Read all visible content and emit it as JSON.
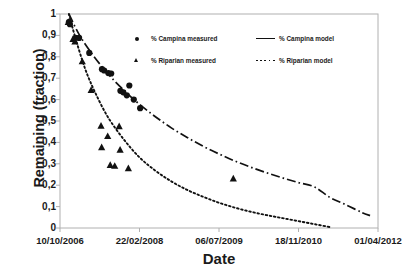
{
  "chart_data": {
    "type": "scatter",
    "title": "",
    "xlabel": "Date",
    "ylabel": "Remaining (fraction)",
    "ylim": [
      0,
      1
    ],
    "ytick_labels": [
      "1",
      "0,9",
      "0,8",
      "0,7",
      "0,6",
      "0,5",
      "0,4",
      "0,3",
      "0,2",
      "0,1",
      "0"
    ],
    "ytick_values": [
      1,
      0.9,
      0.8,
      0.7,
      0.6,
      0.5,
      0.4,
      0.3,
      0.2,
      0.1,
      0
    ],
    "xtick_labels": [
      "10/10/2006",
      "22/02/2008",
      "06/07/2009",
      "18/11/2010",
      "01/04/2012"
    ],
    "xtick_positions": [
      0,
      0.25,
      0.5,
      0.75,
      1.0
    ],
    "grid": false,
    "legend_position": "upper-center",
    "series": [
      {
        "name": "% Campina measured",
        "marker": "circle",
        "kind": "points",
        "color": "#111111",
        "points": [
          {
            "x": 0.028,
            "y": 0.962
          },
          {
            "x": 0.031,
            "y": 0.952
          },
          {
            "x": 0.049,
            "y": 0.889
          },
          {
            "x": 0.06,
            "y": 0.888
          },
          {
            "x": 0.092,
            "y": 0.818
          },
          {
            "x": 0.132,
            "y": 0.742
          },
          {
            "x": 0.139,
            "y": 0.736
          },
          {
            "x": 0.152,
            "y": 0.724
          },
          {
            "x": 0.161,
            "y": 0.722
          },
          {
            "x": 0.19,
            "y": 0.641
          },
          {
            "x": 0.199,
            "y": 0.634
          },
          {
            "x": 0.21,
            "y": 0.62
          },
          {
            "x": 0.218,
            "y": 0.666
          },
          {
            "x": 0.232,
            "y": 0.6
          },
          {
            "x": 0.252,
            "y": 0.56
          }
        ]
      },
      {
        "name": "% Riparian measured",
        "marker": "triangle",
        "kind": "points",
        "color": "#111111",
        "points": [
          {
            "x": 0.026,
            "y": 0.963
          },
          {
            "x": 0.041,
            "y": 0.884
          },
          {
            "x": 0.047,
            "y": 0.872
          },
          {
            "x": 0.07,
            "y": 0.779
          },
          {
            "x": 0.098,
            "y": 0.645
          },
          {
            "x": 0.129,
            "y": 0.478
          },
          {
            "x": 0.15,
            "y": 0.43
          },
          {
            "x": 0.131,
            "y": 0.378
          },
          {
            "x": 0.158,
            "y": 0.295
          },
          {
            "x": 0.172,
            "y": 0.291
          },
          {
            "x": 0.186,
            "y": 0.476
          },
          {
            "x": 0.189,
            "y": 0.366
          },
          {
            "x": 0.215,
            "y": 0.28
          },
          {
            "x": 0.545,
            "y": 0.232
          }
        ]
      },
      {
        "name": "% Campina model",
        "kind": "line",
        "style": "dash-dot",
        "color": "#111111",
        "x": [
          0.028,
          0.06,
          0.1,
          0.15,
          0.2,
          0.25,
          0.3,
          0.35,
          0.4,
          0.45,
          0.5,
          0.55,
          0.6,
          0.65,
          0.7,
          0.75,
          0.8,
          0.85,
          0.9,
          0.95,
          0.975
        ],
        "y": [
          1.0,
          0.905,
          0.815,
          0.722,
          0.645,
          0.578,
          0.52,
          0.468,
          0.423,
          0.382,
          0.346,
          0.313,
          0.284,
          0.258,
          0.234,
          0.212,
          0.192,
          0.142,
          0.108,
          0.072,
          0.058
        ]
      },
      {
        "name": "% Riparian model",
        "kind": "line",
        "style": "dotted",
        "color": "#111111",
        "x": [
          0.028,
          0.05,
          0.08,
          0.11,
          0.15,
          0.2,
          0.25,
          0.3,
          0.35,
          0.4,
          0.45,
          0.5,
          0.55,
          0.6,
          0.65,
          0.7,
          0.75,
          0.8,
          0.85
        ],
        "y": [
          1.0,
          0.88,
          0.74,
          0.635,
          0.52,
          0.415,
          0.33,
          0.268,
          0.218,
          0.178,
          0.146,
          0.118,
          0.095,
          0.076,
          0.06,
          0.046,
          0.032,
          0.018,
          0.004
        ]
      }
    ],
    "legend": [
      {
        "label": "% Campina measured",
        "key": "circle"
      },
      {
        "label": "% Riparian measured",
        "key": "triangle"
      },
      {
        "label": "% Campina model",
        "key": "solid"
      },
      {
        "label": "% Riparian model",
        "key": "dotted"
      }
    ],
    "axis_color": "#b0b0b0"
  }
}
